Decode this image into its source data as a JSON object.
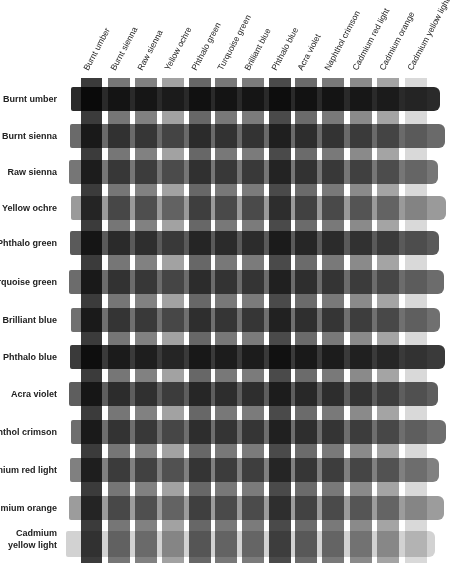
{
  "chart_data": {
    "type": "heatmap",
    "title": "",
    "columns": [
      "Burnt umber",
      "Burnt sienna",
      "Raw sienna",
      "Yellow ochre",
      "Phthalo green",
      "Turquoise green",
      "Brilliant blue",
      "Phthalo blue",
      "Acra violet",
      "Naphthol crimson",
      "Cadmium red light",
      "Cadmium orange",
      "Cadmium yellow light"
    ],
    "rows": [
      "Burnt umber",
      "Burnt sienna",
      "Raw sienna",
      "Yellow ochre",
      "Phthalo green",
      "Turquoise green",
      "Brilliant blue",
      "Phthalo blue",
      "Acra violet",
      "Naphthol crimson",
      "Cadmium red light",
      "Cadmium orange",
      "Cadmium yellow light"
    ],
    "gray_levels": {
      "Burnt umber": "#2a2a2a",
      "Burnt sienna": "#6a6a6a",
      "Raw sienna": "#767676",
      "Yellow ochre": "#9a9a9a",
      "Phthalo green": "#5a5a5a",
      "Turquoise green": "#6c6c6c",
      "Brilliant blue": "#707070",
      "Phthalo blue": "#3a3a3a",
      "Acra violet": "#5e5e5e",
      "Naphthol crimson": "#6e6e6e",
      "Cadmium red light": "#808080",
      "Cadmium orange": "#9c9c9c",
      "Cadmium yellow light": "#d2d2d2"
    },
    "column_x": [
      81,
      108,
      135,
      162,
      189,
      215,
      242,
      269,
      295,
      322,
      350,
      377,
      405
    ],
    "row_y": [
      87,
      124,
      160,
      196,
      231,
      270,
      308,
      345,
      382,
      420,
      458,
      496,
      531
    ],
    "grid": false,
    "legend": "none"
  },
  "labels": {
    "columns": [
      "Burnt umber",
      "Burnt sienna",
      "Raw sienna",
      "Yellow ochre",
      "Phthalo green",
      "Turquoise green",
      "Brilliant blue",
      "Phthalo blue",
      "Acra violet",
      "Naphthol crimson",
      "Cadmium red light",
      "Cadmium orange",
      "Cadmium yellow light"
    ],
    "rows": [
      "Burnt umber",
      "Burnt sienna",
      "Raw sienna",
      "Yellow ochre",
      "Phthalo green",
      "Turquoise green",
      "Brilliant blue",
      "Phthalo blue",
      "Acra violet",
      "Naphthol crimson",
      "Cadmium red light",
      "Cadmium orange",
      "Cadmium yellow light"
    ]
  }
}
